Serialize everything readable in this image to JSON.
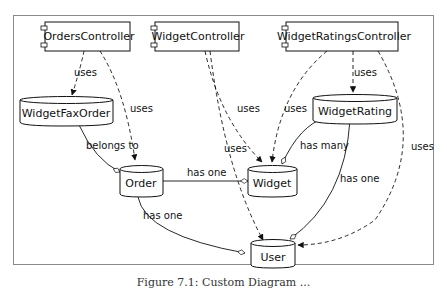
{
  "diagram": {
    "components": [
      {
        "id": "orders_controller",
        "label": "OrdersController"
      },
      {
        "id": "widget_controller",
        "label": "WidgetController"
      },
      {
        "id": "widget_ratings_controller",
        "label": "WidgetRatingsController"
      }
    ],
    "models": [
      {
        "id": "widget_fax_order",
        "label": "WidgetFaxOrder"
      },
      {
        "id": "widget_rating",
        "label": "WidgetRating"
      },
      {
        "id": "order",
        "label": "Order"
      },
      {
        "id": "widget",
        "label": "Widget"
      },
      {
        "id": "user",
        "label": "User"
      }
    ],
    "edges": [
      {
        "from": "OrdersController",
        "to": "WidgetFaxOrder",
        "label": "uses",
        "style": "dashed"
      },
      {
        "from": "OrdersController",
        "to": "Order",
        "label": "uses",
        "style": "dashed"
      },
      {
        "from": "WidgetController",
        "to": "Widget",
        "label": "uses",
        "style": "dashed"
      },
      {
        "from": "WidgetController",
        "to": "User",
        "label": "uses",
        "style": "dashed"
      },
      {
        "from": "WidgetRatingsController",
        "to": "WidgetRating",
        "label": "uses",
        "style": "dashed"
      },
      {
        "from": "WidgetRatingsController",
        "to": "Widget",
        "label": "uses",
        "style": "dashed"
      },
      {
        "from": "WidgetRatingsController",
        "to": "User",
        "label": "uses",
        "style": "dashed"
      },
      {
        "from": "WidgetFaxOrder",
        "to": "Order",
        "label": "belongs to",
        "style": "solid"
      },
      {
        "from": "WidgetRating",
        "to": "Widget",
        "label": "has many",
        "style": "solid"
      },
      {
        "from": "WidgetRating",
        "to": "User",
        "label": "has one",
        "style": "solid"
      },
      {
        "from": "Order",
        "to": "Widget",
        "label": "has one",
        "style": "solid"
      },
      {
        "from": "Order",
        "to": "User",
        "label": "has one",
        "style": "solid"
      }
    ],
    "labels": {
      "uses": "uses",
      "belongs_to": "belongs to",
      "has_one": "has one",
      "has_many": "has many"
    }
  },
  "caption": {
    "text": "Figure 7.1: Custom Diagram ...",
    "status": "partially legible",
    "note": "Bottom half of the caption line is clipped; only 'Figure 7.1: Custom Diagram' is readable with any confidence, and the rest is unreadable."
  }
}
